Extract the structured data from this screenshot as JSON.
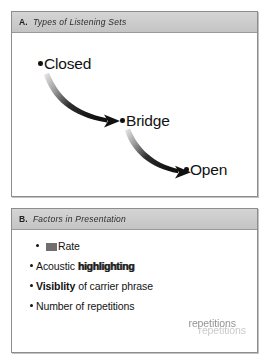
{
  "figure": {
    "panels": [
      {
        "id": "A",
        "letter": "A.",
        "title": "Types of Listening Sets",
        "type": "flow-diagram",
        "nodes": [
          {
            "label": "Closed"
          },
          {
            "label": "Bridge"
          },
          {
            "label": "Open"
          }
        ],
        "arrows": [
          {
            "from": "Closed",
            "to": "Bridge",
            "style": "tapered-curve"
          },
          {
            "from": "Bridge",
            "to": "Open",
            "style": "tapered-curve"
          }
        ]
      },
      {
        "id": "B",
        "letter": "B.",
        "title": "Factors in Presentation",
        "type": "bullet-list",
        "bullets": [
          {
            "prefix": "",
            "text": "Rate",
            "marked": true
          },
          {
            "prefix": "Acoustic",
            "text": "highlighting",
            "emphasis": "highlighted"
          },
          {
            "prefix": "Visiblity",
            "text": "of carrier phrase",
            "emphasis": "bold-lead"
          },
          {
            "prefix": "Number of",
            "text": "repetitions",
            "echo": [
              "repetitions",
              "repetitions"
            ]
          }
        ]
      }
    ]
  },
  "colors": {
    "panel_border": "#8d8d8d",
    "header_band": "#cfcfcf",
    "text": "#131313",
    "arrow": "#111111",
    "redaction": "#6f6f6f"
  }
}
